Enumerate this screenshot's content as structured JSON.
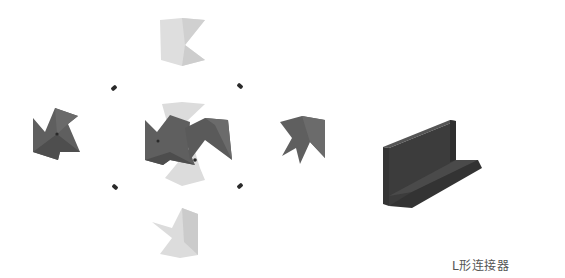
{
  "diagram": {
    "title": "L形连接器",
    "colors": {
      "background": "#ffffff",
      "dark_piece": "#5f5f5f",
      "dark_piece_shade": "#4c4c4c",
      "light_piece": "#dcdcdc",
      "light_piece_shade": "#cbcbcb",
      "marker": "#2a2a2a",
      "connector_front": "#3c3c3c",
      "connector_top": "#555555",
      "connector_side": "#2e2e2e",
      "caption": "#555555"
    },
    "parts": [
      {
        "name": "top-light-piece",
        "shade": "light"
      },
      {
        "name": "left-dark-piece",
        "shade": "dark"
      },
      {
        "name": "center-assembly",
        "shade": "mixed"
      },
      {
        "name": "right-dark-piece",
        "shade": "dark"
      },
      {
        "name": "bottom-light-piece",
        "shade": "light"
      },
      {
        "name": "l-connector-3d",
        "shade": "dark"
      }
    ],
    "markers": 4
  }
}
